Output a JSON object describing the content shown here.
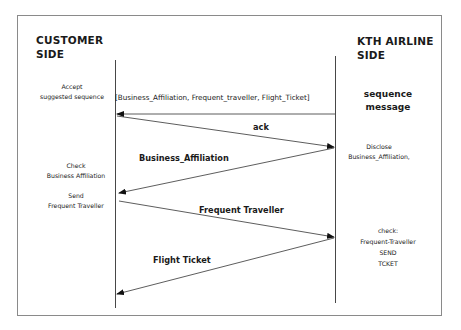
{
  "diagram": {
    "type": "sequence-diagram",
    "participants": [
      {
        "id": "customer",
        "label_line1": "CUSTOMER",
        "label_line2": "SIDE"
      },
      {
        "id": "airline",
        "label_line1": "KTH AIRLINE",
        "label_line2": "SIDE"
      }
    ],
    "left_notes": {
      "accept_line1": "Accept",
      "accept_line2": "suggested sequence",
      "check_line1": "Check",
      "check_line2": "Business Affiliation",
      "send_line1": "Send",
      "send_line2": "Frequent Traveller"
    },
    "right_notes": {
      "sequence_line1": "sequence",
      "sequence_line2": "message",
      "disclose_line1": "Disclose",
      "disclose_line2": "Business_Affiliation,",
      "check_line1": "check:",
      "check_line2": "Frequent-Traveller",
      "check_line3": "SEND",
      "check_line4": "TCKET"
    },
    "messages": [
      {
        "label": "[Business_Affiliation, Frequent_traveller, Flight_Ticket]",
        "from": "airline",
        "to": "customer"
      },
      {
        "label": "ack",
        "from": "customer",
        "to": "airline"
      },
      {
        "label": "Business_Affiliation",
        "from": "airline",
        "to": "customer"
      },
      {
        "label": "Frequent Traveller",
        "from": "customer",
        "to": "airline"
      },
      {
        "label": "Flight Ticket",
        "from": "airline",
        "to": "customer"
      }
    ]
  }
}
